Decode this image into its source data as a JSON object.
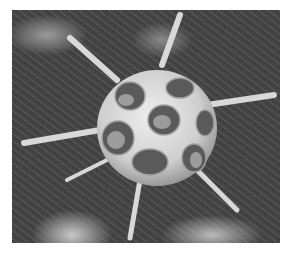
{
  "image": {
    "subject": "radiolarian skeleton micrograph",
    "alt": "Scanning electron micrograph of a spherical lattice-shelled radiolarian with radiating spines on a dark textured background",
    "colors": {
      "background": "#ffffff",
      "substrate": "#444444",
      "shell": "#dcdcdc",
      "shell_shadow": "#8c8c8c"
    }
  }
}
